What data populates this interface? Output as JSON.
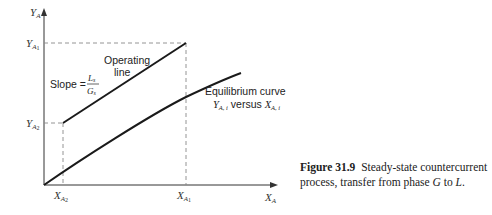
{
  "figure": {
    "caption_label": "Figure 31.9",
    "caption_text_1": "Steady-state countercurrent process, transfer from phase ",
    "caption_G": "G",
    "caption_text_2": " to ",
    "caption_L": "L",
    "caption_text_3": "."
  },
  "axes": {
    "y_label": "Y",
    "y_label_sub": "A",
    "x_label": "X",
    "x_label_sub": "A"
  },
  "ticks": {
    "y_top": {
      "main": "Y",
      "sub": "A",
      "subsub": "1"
    },
    "y_bottom": {
      "main": "Y",
      "sub": "A",
      "subsub": "2"
    },
    "x_left": {
      "main": "X",
      "sub": "A",
      "subsub": "2"
    },
    "x_right": {
      "main": "X",
      "sub": "A",
      "subsub": "1"
    }
  },
  "annotations": {
    "operating_line_1": "Operating",
    "operating_line_2": "line",
    "slope_label": "Slope =",
    "slope_num": "L",
    "slope_num_sub": "s",
    "slope_den": "G",
    "slope_den_sub": "s",
    "equilibrium_1": "Equilibrium curve",
    "equilibrium_Y": "Y",
    "equilibrium_Y_sub": "A, i",
    "equilibrium_versus": " versus ",
    "equilibrium_X": "X",
    "equilibrium_X_sub": "A, i"
  },
  "colors": {
    "line": "#1a1a1a",
    "dashed": "#777777",
    "text": "#222222"
  }
}
